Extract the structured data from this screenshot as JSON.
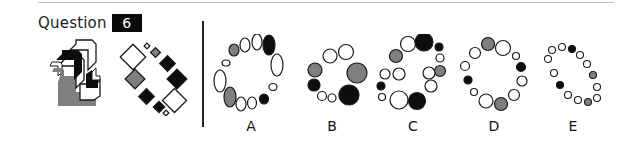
{
  "question": {
    "label": "Question",
    "number": "6"
  },
  "sequence": [
    {
      "id": "seq-1",
      "description": "stacked chevron arrows (black, white, grey)"
    },
    {
      "id": "seq-2",
      "description": "diagonal ring of squares (white, grey, black)"
    }
  ],
  "options": [
    {
      "letter": "A",
      "description": "ring of ellipses"
    },
    {
      "letter": "B",
      "description": "ring of circles, varied sizes"
    },
    {
      "letter": "C",
      "description": "double ring of circles"
    },
    {
      "letter": "D",
      "description": "ring of circles"
    },
    {
      "letter": "E",
      "description": "diagonal oval of small circles"
    }
  ],
  "colors": {
    "black": "#0d0d0d",
    "grey": "#7f7f7f",
    "white": "#ffffff",
    "stroke": "#1a1a1a"
  }
}
